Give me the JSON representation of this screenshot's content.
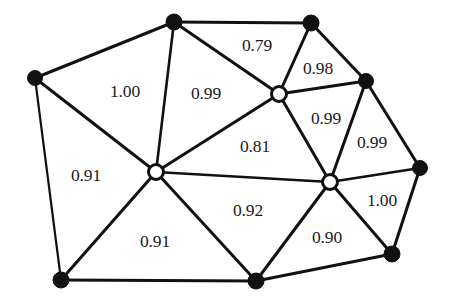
{
  "figure": {
    "type": "planar-graph-diagram",
    "background_color": "#ffffff",
    "edge_color": "#111111",
    "node_fill_filled": "#111111",
    "node_fill_hollow": "#ffffff",
    "node_stroke": "#111111",
    "label_color": "#1a1a1a",
    "width": 452,
    "height": 302
  },
  "nodes": [
    {
      "id": "n0",
      "name": "node-top-left-outer",
      "x": 35,
      "y": 78,
      "style": "filled",
      "r": 7.5
    },
    {
      "id": "n1",
      "name": "node-top-center",
      "x": 174,
      "y": 22,
      "style": "filled",
      "r": 8.0
    },
    {
      "id": "n2",
      "name": "node-top-right",
      "x": 311,
      "y": 23,
      "style": "filled",
      "r": 8.0
    },
    {
      "id": "n3",
      "name": "node-upper-hollow",
      "x": 279,
      "y": 94,
      "style": "hollow",
      "r": 7.5
    },
    {
      "id": "n4",
      "name": "node-right-upper",
      "x": 366,
      "y": 81,
      "style": "filled",
      "r": 7.5
    },
    {
      "id": "n5",
      "name": "node-center-hollow",
      "x": 156,
      "y": 172,
      "style": "hollow",
      "r": 7.5
    },
    {
      "id": "n6",
      "name": "node-right-hollow",
      "x": 330,
      "y": 182,
      "style": "hollow",
      "r": 7.5
    },
    {
      "id": "n7",
      "name": "node-far-right",
      "x": 420,
      "y": 168,
      "style": "filled",
      "r": 7.5
    },
    {
      "id": "n8",
      "name": "node-bottom-left",
      "x": 61,
      "y": 280,
      "style": "filled",
      "r": 8.0
    },
    {
      "id": "n9",
      "name": "node-bottom-center",
      "x": 256,
      "y": 281,
      "style": "filled",
      "r": 8.0
    },
    {
      "id": "n10",
      "name": "node-bottom-right",
      "x": 392,
      "y": 254,
      "style": "filled",
      "r": 8.0
    }
  ],
  "edges": [
    {
      "name": "edge-n0-n1",
      "from": "n0",
      "to": "n1",
      "width": 3.0
    },
    {
      "name": "edge-n1-n2",
      "from": "n1",
      "to": "n2",
      "width": 3.0
    },
    {
      "name": "edge-n0-n5",
      "from": "n0",
      "to": "n5",
      "width": 3.0
    },
    {
      "name": "edge-n0-n8",
      "from": "n0",
      "to": "n8",
      "width": 2.2
    },
    {
      "name": "edge-n1-n5",
      "from": "n1",
      "to": "n5",
      "width": 2.6
    },
    {
      "name": "edge-n1-n3",
      "from": "n1",
      "to": "n3",
      "width": 3.0
    },
    {
      "name": "edge-n2-n3",
      "from": "n2",
      "to": "n3",
      "width": 3.0
    },
    {
      "name": "edge-n2-n4",
      "from": "n2",
      "to": "n4",
      "width": 3.0
    },
    {
      "name": "edge-n3-n4",
      "from": "n3",
      "to": "n4",
      "width": 3.0
    },
    {
      "name": "edge-n3-n5",
      "from": "n3",
      "to": "n5",
      "width": 3.0
    },
    {
      "name": "edge-n3-n6",
      "from": "n3",
      "to": "n6",
      "width": 3.0
    },
    {
      "name": "edge-n4-n6",
      "from": "n4",
      "to": "n6",
      "width": 3.0
    },
    {
      "name": "edge-n4-n7",
      "from": "n4",
      "to": "n7",
      "width": 3.0
    },
    {
      "name": "edge-n5-n6",
      "from": "n5",
      "to": "n6",
      "width": 2.4
    },
    {
      "name": "edge-n5-n8",
      "from": "n5",
      "to": "n8",
      "width": 3.0
    },
    {
      "name": "edge-n5-n9",
      "from": "n5",
      "to": "n9",
      "width": 3.0
    },
    {
      "name": "edge-n6-n7",
      "from": "n6",
      "to": "n7",
      "width": 2.6
    },
    {
      "name": "edge-n6-n9",
      "from": "n6",
      "to": "n9",
      "width": 3.0
    },
    {
      "name": "edge-n6-n10",
      "from": "n6",
      "to": "n10",
      "width": 3.0
    },
    {
      "name": "edge-n7-n10",
      "from": "n7",
      "to": "n10",
      "width": 3.0
    },
    {
      "name": "edge-n8-n9",
      "from": "n8",
      "to": "n9",
      "width": 3.0
    },
    {
      "name": "edge-n9-n10",
      "from": "n9",
      "to": "n10",
      "width": 3.0
    }
  ],
  "face_labels": [
    {
      "name": "face-label-1.00-upper-left",
      "value": "1.00",
      "x": 125,
      "y": 92
    },
    {
      "name": "face-label-0.99-upper",
      "value": "0.99",
      "x": 206,
      "y": 94
    },
    {
      "name": "face-label-0.79",
      "value": "0.79",
      "x": 257,
      "y": 46
    },
    {
      "name": "face-label-0.98",
      "value": "0.98",
      "x": 318,
      "y": 69
    },
    {
      "name": "face-label-0.99-right-mid",
      "value": "0.99",
      "x": 326,
      "y": 119
    },
    {
      "name": "face-label-0.99-far-right",
      "value": "0.99",
      "x": 372,
      "y": 143
    },
    {
      "name": "face-label-0.81",
      "value": "0.81",
      "x": 255,
      "y": 147
    },
    {
      "name": "face-label-0.91-left",
      "value": "0.91",
      "x": 86,
      "y": 176
    },
    {
      "name": "face-label-0.92",
      "value": "0.92",
      "x": 248,
      "y": 211
    },
    {
      "name": "face-label-1.00-right",
      "value": "1.00",
      "x": 382,
      "y": 201
    },
    {
      "name": "face-label-0.91-bottom",
      "value": "0.91",
      "x": 155,
      "y": 242
    },
    {
      "name": "face-label-0.90",
      "value": "0.90",
      "x": 327,
      "y": 238
    }
  ]
}
